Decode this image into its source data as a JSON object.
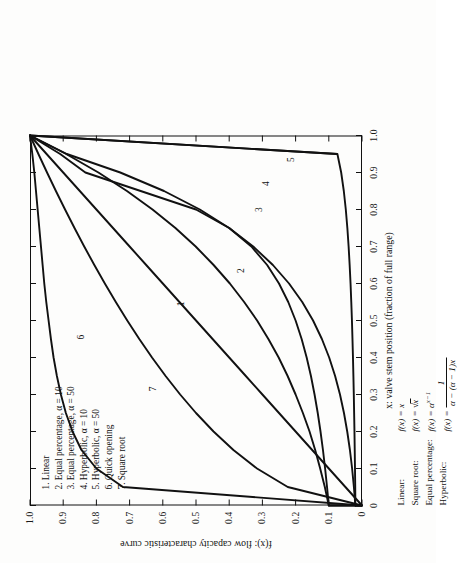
{
  "figure": {
    "background": "#fdfdfc",
    "ink": "#111111",
    "rotation_deg": -90
  },
  "axes": {
    "x_title": "x: valve stem position (fraction of full range)",
    "y_title": "f(x): flow capacity characteristic curve",
    "x_ticks": [
      "0",
      "0.1",
      "0.2",
      "0.3",
      "0.4",
      "0.5",
      "0.6",
      "0.7",
      "0.8",
      "0.9",
      "1.0"
    ],
    "y_ticks": [
      "0",
      "0.1",
      "0.2",
      "0.3",
      "0.4",
      "0.5",
      "0.6",
      "0.7",
      "0.8",
      "0.9",
      "1.0"
    ],
    "xlim": [
      0,
      1
    ],
    "ylim": [
      0,
      1
    ],
    "grid": false
  },
  "legend": {
    "position": "upper-left-inside",
    "items": [
      "1. Linear",
      "2. Equal percentage, α = 10",
      "3. Equal percentage, α = 50",
      "4. Hyperbolic, α = 10",
      "5. Hyperbolic, α = 50",
      "6. Quick opening",
      "7. Square root"
    ]
  },
  "formulas": [
    {
      "name": "Linear:",
      "lhs": "f(x) =",
      "rhs_kind": "plain",
      "rhs": "x"
    },
    {
      "name": "Square root:",
      "lhs": "f(x) =",
      "rhs_kind": "sqrt",
      "rhs": "x"
    },
    {
      "name": "Equal percentage:",
      "lhs": "f(x) =",
      "rhs_kind": "power",
      "rhs_base": "α",
      "rhs_exp": "x−1"
    },
    {
      "name": "Hyperbolic:",
      "lhs": "f(x) =",
      "rhs_kind": "frac",
      "num": "1",
      "den": "α − (α − 1)x"
    }
  ],
  "curve_labels": [
    {
      "id": "1",
      "x": 0.545,
      "y": 0.545
    },
    {
      "id": "2",
      "x": 0.635,
      "y": 0.365
    },
    {
      "id": "3",
      "x": 0.8,
      "y": 0.31
    },
    {
      "id": "4",
      "x": 0.87,
      "y": 0.29
    },
    {
      "id": "5",
      "x": 0.935,
      "y": 0.215
    },
    {
      "id": "6",
      "x": 0.455,
      "y": 0.845
    },
    {
      "id": "7",
      "x": 0.315,
      "y": 0.63
    }
  ],
  "chart_data": {
    "type": "line",
    "title": "",
    "xlabel": "x: valve stem position (fraction of full range)",
    "ylabel": "f(x): flow capacity characteristic curve",
    "xlim": [
      0,
      1
    ],
    "ylim": [
      0,
      1
    ],
    "grid": false,
    "legend_position": "upper-left-inside",
    "x": [
      0,
      0.05,
      0.1,
      0.15,
      0.2,
      0.25,
      0.3,
      0.35,
      0.4,
      0.45,
      0.5,
      0.55,
      0.6,
      0.65,
      0.7,
      0.75,
      0.8,
      0.85,
      0.9,
      0.95,
      1.0
    ],
    "series": [
      {
        "name": "1. Linear",
        "label": "1",
        "formula": "f(x) = x",
        "values": [
          0,
          0.05,
          0.1,
          0.15,
          0.2,
          0.25,
          0.3,
          0.35,
          0.4,
          0.45,
          0.5,
          0.55,
          0.6,
          0.65,
          0.7,
          0.75,
          0.8,
          0.85,
          0.9,
          0.95,
          1.0
        ]
      },
      {
        "name": "2. Equal percentage, α = 10",
        "label": "2",
        "formula": "f(x) = α^(x−1), α = 10",
        "values": [
          0.1,
          0.112,
          0.126,
          0.141,
          0.158,
          0.178,
          0.2,
          0.224,
          0.251,
          0.282,
          0.316,
          0.355,
          0.398,
          0.447,
          0.501,
          0.562,
          0.631,
          0.708,
          0.794,
          0.891,
          1.0
        ]
      },
      {
        "name": "3. Equal percentage, α = 50",
        "label": "3",
        "formula": "f(x) = α^(x−1), α = 50",
        "values": [
          0.02,
          0.0244,
          0.0298,
          0.0364,
          0.0445,
          0.0543,
          0.0663,
          0.081,
          0.0989,
          0.1208,
          0.1474,
          0.18,
          0.2198,
          0.2684,
          0.3277,
          0.4001,
          0.4885,
          0.5964,
          0.7282,
          0.8891,
          1.0
        ]
      },
      {
        "name": "4. Hyperbolic, α = 10",
        "label": "4",
        "formula": "f(x) = 1/(α − (α−1)x), α = 10",
        "values": [
          0.1,
          0.1053,
          0.1111,
          0.1176,
          0.125,
          0.1333,
          0.1429,
          0.1538,
          0.1667,
          0.1818,
          0.2,
          0.2222,
          0.25,
          0.2857,
          0.3333,
          0.4,
          0.5,
          0.6667,
          0.8333,
          0.9091,
          1.0
        ]
      },
      {
        "name": "5. Hyperbolic, α = 50",
        "label": "5",
        "formula": "f(x) = 1/(α − (α−1)x), α = 50",
        "values": [
          0.02,
          0.0204,
          0.0211,
          0.0219,
          0.0227,
          0.0237,
          0.0247,
          0.0259,
          0.0272,
          0.0287,
          0.0303,
          0.0323,
          0.0345,
          0.0372,
          0.0403,
          0.0441,
          0.0488,
          0.0548,
          0.0627,
          0.0741,
          1.0
        ]
      },
      {
        "name": "6. Quick opening",
        "label": "6",
        "formula": "quick opening",
        "values": [
          0,
          0.72,
          0.8,
          0.845,
          0.872,
          0.892,
          0.907,
          0.919,
          0.929,
          0.937,
          0.944,
          0.951,
          0.957,
          0.962,
          0.967,
          0.972,
          0.977,
          0.982,
          0.987,
          0.993,
          1.0
        ]
      },
      {
        "name": "7. Square root",
        "label": "7",
        "formula": "f(x) = √x",
        "values": [
          0,
          0.2236,
          0.3162,
          0.3873,
          0.4472,
          0.5,
          0.5477,
          0.5916,
          0.6325,
          0.6708,
          0.7071,
          0.7416,
          0.7746,
          0.8062,
          0.8367,
          0.866,
          0.8944,
          0.922,
          0.9487,
          0.9747,
          1.0
        ]
      }
    ]
  }
}
